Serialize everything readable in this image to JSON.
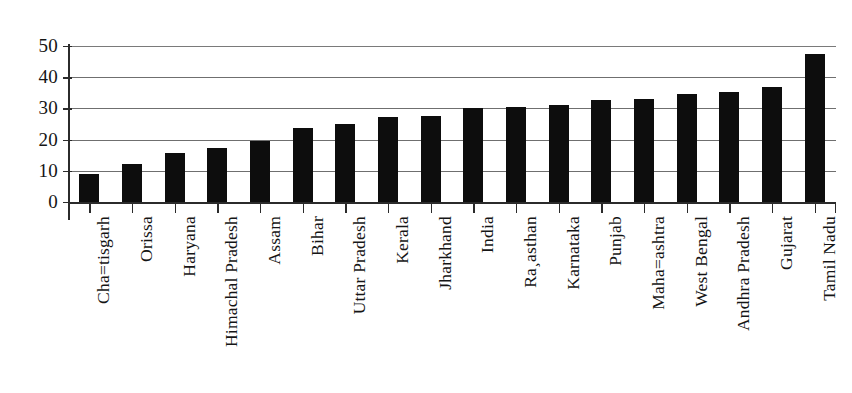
{
  "chart_data": {
    "type": "bar",
    "title": "",
    "subtitle": "",
    "xlabel": "",
    "ylabel": "",
    "ylim": [
      0,
      50
    ],
    "yticks": [
      "0",
      "10",
      "20",
      "30",
      "40",
      "50"
    ],
    "ytick_values": [
      0,
      10,
      20,
      30,
      40,
      50
    ],
    "grid": true,
    "legend": "none",
    "bar_color": "#0d0d0d",
    "categories": [
      "Cha=tisgarh",
      "Orissa",
      "Haryana",
      "Himachal Pradesh",
      "Assam",
      "Bihar",
      "Uttar Pradesh",
      "Kerala",
      "Jharkhand",
      "India",
      "Ra¸asthan",
      "Karnataka",
      "Punjab",
      "Maha=ashtra",
      "West Bengal",
      "Andhra Pradesh",
      "Gujarat",
      "Tamil Nadu"
    ],
    "values": [
      9.0,
      12.3,
      15.7,
      17.3,
      19.4,
      23.8,
      25.0,
      27.4,
      27.6,
      30.2,
      30.4,
      31.0,
      32.8,
      32.9,
      34.6,
      35.3,
      36.9,
      47.3
    ]
  }
}
